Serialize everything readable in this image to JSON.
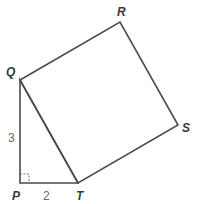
{
  "figure": {
    "vertices": {
      "P": {
        "label": "P",
        "x": 20,
        "y": 183
      },
      "Q": {
        "label": "Q",
        "x": 20,
        "y": 80
      },
      "R": {
        "label": "R",
        "x": 120,
        "y": 22
      },
      "S": {
        "label": "S",
        "x": 178,
        "y": 125
      },
      "T": {
        "label": "T",
        "x": 78,
        "y": 183
      }
    },
    "labels": {
      "P": "P",
      "Q": "Q",
      "R": "R",
      "S": "S",
      "T": "T"
    },
    "measurements": {
      "PQ": "3",
      "PT": "2"
    },
    "right_angle_at": "P",
    "shapes": [
      "right triangle PQT",
      "square QRST"
    ],
    "colors": {
      "stroke": "#4a4a4a",
      "label": "#3a3a3a",
      "measure": "#6a6a6a",
      "background": "#ffffff"
    }
  }
}
